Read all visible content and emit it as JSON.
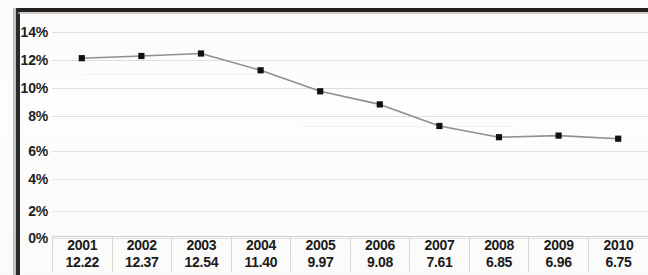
{
  "chart_data": {
    "type": "line",
    "title": "",
    "subtitle": "",
    "xlabel": "",
    "ylabel": "",
    "categories": [
      "2001",
      "2002",
      "2003",
      "2004",
      "2005",
      "2006",
      "2007",
      "2008",
      "2009",
      "2010"
    ],
    "values": [
      12.22,
      12.37,
      12.54,
      11.4,
      9.97,
      9.08,
      7.61,
      6.85,
      6.96,
      6.75
    ],
    "series": [
      {
        "name": "",
        "values": [
          12.22,
          12.37,
          12.54,
          11.4,
          9.97,
          9.08,
          7.61,
          6.85,
          6.96,
          6.75
        ]
      }
    ],
    "ylim": [
      0,
      14
    ],
    "ytick_labels": [
      "14%",
      "12%",
      "10%",
      "8%",
      "6%",
      "4%",
      "2%",
      "0%"
    ],
    "ytick_values": [
      14,
      12,
      10,
      8,
      6,
      4,
      2,
      0
    ],
    "grid": true,
    "legend": "none",
    "value_format": "percent",
    "marker": "square",
    "line_color": "#8a8a8a",
    "marker_color": "#111111",
    "grid_color": "#d9d9d7",
    "axis_text_color": "#1f1f1f",
    "background_color": "#fdfdfc"
  },
  "data_table": {
    "header_row": [
      "2001",
      "2002",
      "2003",
      "2004",
      "2005",
      "2006",
      "2007",
      "2008",
      "2009",
      "2010"
    ],
    "value_row": [
      "12.22",
      "12.37",
      "12.54",
      "11.40",
      "9.97",
      "9.08",
      "7.61",
      "6.85",
      "6.96",
      "6.75"
    ]
  },
  "axis": {
    "y_labels": [
      "14%",
      "12%",
      "10%",
      "8%",
      "6%",
      "4%",
      "2%",
      "0%"
    ]
  }
}
